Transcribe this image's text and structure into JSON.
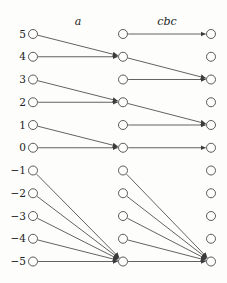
{
  "figure": {
    "column_headers": [
      {
        "id": "a",
        "label": "a"
      },
      {
        "id": "cbc",
        "label": "cbc"
      }
    ],
    "columns": [
      "left",
      "middle",
      "right"
    ],
    "row_values": [
      5,
      4,
      3,
      2,
      1,
      0,
      -1,
      -2,
      -3,
      -4,
      -5
    ],
    "row_labels": [
      "5",
      "4",
      "3",
      "2",
      "1",
      "0",
      "−1",
      "−2",
      "−3",
      "−4",
      "−5"
    ],
    "edges": {
      "a": [
        [
          5,
          4
        ],
        [
          4,
          4
        ],
        [
          3,
          2
        ],
        [
          2,
          2
        ],
        [
          1,
          0
        ],
        [
          0,
          0
        ],
        [
          -1,
          -5
        ],
        [
          -2,
          -5
        ],
        [
          -3,
          -5
        ],
        [
          -4,
          -5
        ],
        [
          -5,
          -5
        ]
      ],
      "cbc": [
        [
          5,
          5
        ],
        [
          4,
          3
        ],
        [
          3,
          3
        ],
        [
          2,
          1
        ],
        [
          1,
          1
        ],
        [
          0,
          0
        ],
        [
          -1,
          -5
        ],
        [
          -2,
          -5
        ],
        [
          -3,
          -5
        ],
        [
          -4,
          -5
        ],
        [
          -5,
          -5
        ]
      ]
    },
    "colors": {
      "line": "#3b3b3b",
      "node_stroke": "#4a4a4a",
      "node_fill": "#fdfdfc",
      "background": "#fdfdfc",
      "text": "#222222"
    }
  }
}
